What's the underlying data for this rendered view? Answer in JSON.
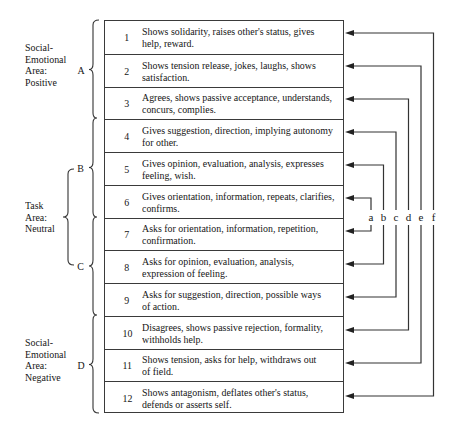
{
  "areas": {
    "positive": {
      "label_lines": [
        "Social-",
        "Emotional",
        "Area:",
        "Positive"
      ],
      "letter": "A"
    },
    "task": {
      "label_lines": [
        "Task",
        "Area:",
        "Neutral"
      ],
      "sub_letters": [
        "B",
        "C"
      ]
    },
    "negative": {
      "label_lines": [
        "Social-",
        "Emotional",
        "Area:",
        "Negative"
      ],
      "letter": "D"
    }
  },
  "categories": [
    {
      "number": "1",
      "lines": [
        "Shows solidarity, raises other's status, gives",
        "help, reward."
      ]
    },
    {
      "number": "2",
      "lines": [
        "Shows tension release, jokes, laughs, shows",
        "satisfaction."
      ]
    },
    {
      "number": "3",
      "lines": [
        "Agrees, shows passive acceptance, understands,",
        "concurs, complies."
      ]
    },
    {
      "number": "4",
      "lines": [
        "Gives suggestion, direction, implying autonomy",
        "for other."
      ]
    },
    {
      "number": "5",
      "lines": [
        "Gives opinion, evaluation, analysis, expresses",
        "feeling, wish."
      ]
    },
    {
      "number": "6",
      "lines": [
        "Gives orientation, information, repeats, clarifies,",
        "confirms."
      ]
    },
    {
      "number": "7",
      "lines": [
        "Asks for orientation, information, repetition,",
        "confirmation."
      ]
    },
    {
      "number": "8",
      "lines": [
        "Asks for opinion, evaluation, analysis,",
        "expression of feeling."
      ]
    },
    {
      "number": "9",
      "lines": [
        "Asks for suggestion, direction, possible ways",
        "of action."
      ]
    },
    {
      "number": "10",
      "lines": [
        "Disagrees, shows passive rejection, formality,",
        "withholds help."
      ]
    },
    {
      "number": "11",
      "lines": [
        "Shows tension, asks for help, withdraws out",
        "of field."
      ]
    },
    {
      "number": "12",
      "lines": [
        "Shows antagonism, deflates other's status,",
        "defends or asserts self."
      ]
    }
  ],
  "connectors": [
    {
      "label": "a",
      "links": [
        "6",
        "7"
      ]
    },
    {
      "label": "b",
      "links": [
        "5",
        "8"
      ]
    },
    {
      "label": "c",
      "links": [
        "4",
        "9"
      ]
    },
    {
      "label": "d",
      "links": [
        "3",
        "10"
      ]
    },
    {
      "label": "e",
      "links": [
        "2",
        "11"
      ]
    },
    {
      "label": "f",
      "links": [
        "1",
        "12"
      ]
    }
  ],
  "colors": {
    "line": "#333333",
    "text": "#161616",
    "background": "#ffffff"
  }
}
